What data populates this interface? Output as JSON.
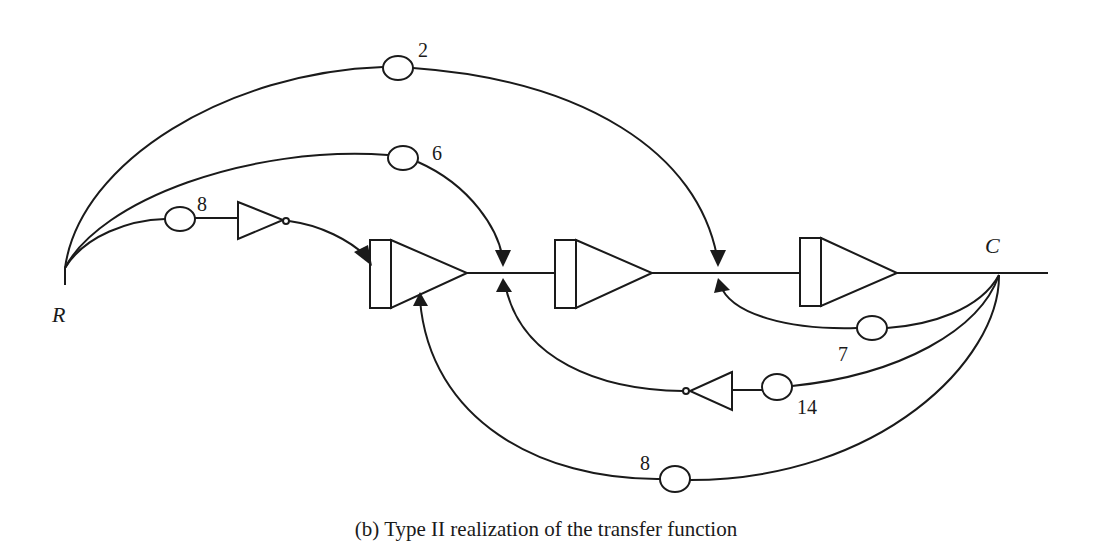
{
  "figure": {
    "caption": "(b) Type II realization of the transfer function",
    "nodes": {
      "input": "R",
      "output": "C"
    },
    "feedforward_gains": {
      "top": "2",
      "middle": "6",
      "inner": "8"
    },
    "feedback_gains": {
      "inner": "7",
      "middle": "14",
      "outer": "8"
    },
    "blocks": {
      "integrators": [
        "integrator-1",
        "integrator-2",
        "integrator-3"
      ],
      "inverters": [
        "inverter-forward",
        "inverter-feedback"
      ]
    }
  }
}
